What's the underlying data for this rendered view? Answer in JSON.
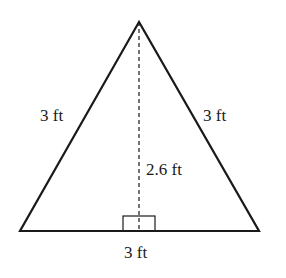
{
  "figure": {
    "shape": "equilateral-triangle",
    "labels": {
      "left_side": "3 ft",
      "right_side": "3 ft",
      "height": "2.6 ft",
      "base": "3 ft"
    },
    "colors": {
      "stroke": "#1a1a1a",
      "background": "#ffffff"
    }
  }
}
